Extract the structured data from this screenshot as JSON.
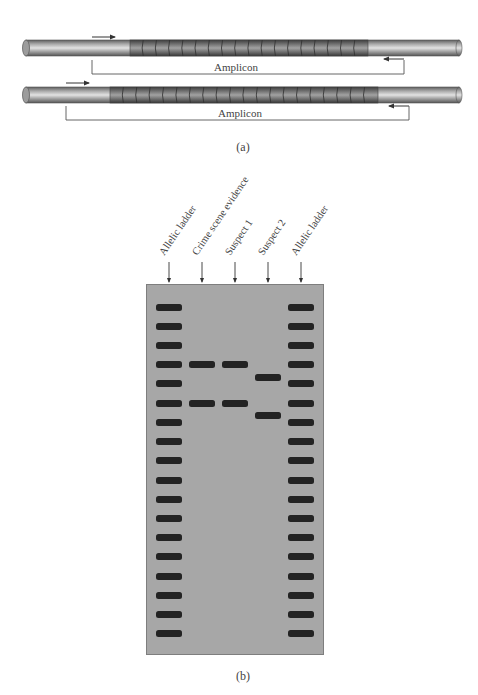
{
  "panel_a": {
    "caption": "(a)",
    "strands": [
      {
        "name": "allele-short",
        "repeat_count": 18,
        "amplicon_label": "Amplicon",
        "strand": {
          "x1": 26,
          "x2": 459,
          "cy": 48
        },
        "repeat_region": {
          "x1": 130,
          "x2": 368
        },
        "forward_primer": {
          "x1": 92,
          "x2": 115,
          "y": 37
        },
        "reverse_primer": {
          "x1": 404,
          "x2": 384,
          "y": 59
        },
        "bracket": {
          "left": 92,
          "right": 404,
          "top": 60,
          "bottom": 74
        },
        "label_pos": {
          "x": 236,
          "y": 67
        }
      },
      {
        "name": "allele-long",
        "repeat_count": 20,
        "amplicon_label": "Amplicon",
        "strand": {
          "x1": 26,
          "x2": 459,
          "cy": 95
        },
        "repeat_region": {
          "x1": 110,
          "x2": 378
        },
        "forward_primer": {
          "x1": 66,
          "x2": 89,
          "y": 83
        },
        "reverse_primer": {
          "x1": 409,
          "x2": 389,
          "y": 106
        },
        "bracket": {
          "left": 66,
          "right": 409,
          "top": 106,
          "bottom": 120
        },
        "label_pos": {
          "x": 240,
          "y": 113
        }
      }
    ],
    "colors": {
      "strand_light": "#d9d9d9",
      "strand_dark": "#6a6a6a",
      "repeat_dark": "#5c5c5c",
      "repeat_light": "#9a9a9a",
      "line": "#555555"
    }
  },
  "panel_b": {
    "caption": "(b)",
    "gel": {
      "x": 146,
      "y": 284,
      "width": 178,
      "height": 371,
      "color": "#a7a7a7",
      "band_color": "#232323"
    },
    "lanes": [
      {
        "label": "Allelic ladder",
        "x": 169,
        "band_x": 156,
        "bands_y": [
          307,
          326,
          345,
          364,
          383,
          403,
          422,
          441,
          460,
          480,
          499,
          518,
          537,
          556,
          576,
          595,
          614,
          633
        ]
      },
      {
        "label": "Crime scene evidence",
        "x": 202,
        "band_x": 189,
        "bands_y": [
          364,
          403
        ]
      },
      {
        "label": "Suspect 1",
        "x": 235,
        "band_x": 222,
        "bands_y": [
          364,
          403
        ]
      },
      {
        "label": "Suspect 2",
        "x": 268,
        "band_x": 255,
        "bands_y": [
          377,
          415
        ]
      },
      {
        "label": "Allelic ladder",
        "x": 301,
        "band_x": 288,
        "bands_y": [
          307,
          326,
          345,
          364,
          383,
          403,
          422,
          441,
          460,
          480,
          499,
          518,
          537,
          556,
          576,
          595,
          614,
          633
        ]
      }
    ],
    "arrow": {
      "y1": 262,
      "y2": 282
    }
  }
}
